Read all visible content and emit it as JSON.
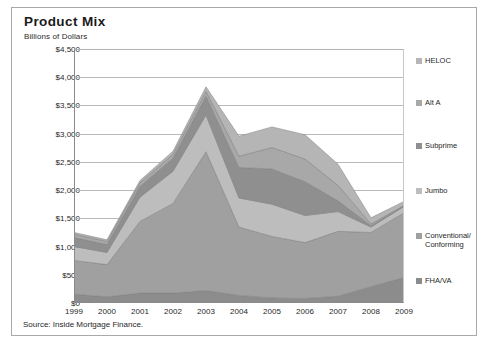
{
  "figure": {
    "title": "Product Mix",
    "subtitle": "Billions of Dollars",
    "source": "Source: Inside Mortgage Finance."
  },
  "chart_data": {
    "type": "area",
    "stacked": true,
    "title": "Product Mix",
    "subtitle": "Billions of Dollars",
    "xlabel": "",
    "ylabel": "Billions of Dollars",
    "ylim": [
      0,
      4500
    ],
    "ytick_step": 500,
    "yticks": [
      0,
      500,
      1000,
      1500,
      2000,
      2500,
      3000,
      3500,
      4000,
      4500
    ],
    "ytick_labels": [
      "$0",
      "$500",
      "$1,000",
      "$1,500",
      "$2,000",
      "$2,500",
      "$3,000",
      "$3,500",
      "$4,000",
      "$4,500"
    ],
    "categories": [
      1999,
      2000,
      2001,
      2002,
      2003,
      2004,
      2005,
      2006,
      2007,
      2008,
      2009
    ],
    "x": [
      "1999",
      "2000",
      "2001",
      "2002",
      "2003",
      "2004",
      "2005",
      "2006",
      "2007",
      "2008",
      "2009"
    ],
    "grid": true,
    "legend_position": "right",
    "series": [
      {
        "name": "FHA/VA",
        "color": "#8c8c8c",
        "values": [
          155,
          110,
          175,
          175,
          220,
          135,
          90,
          80,
          120,
          290,
          450
        ]
      },
      {
        "name": "Conventional/Conforming",
        "color": "#a0a0a0",
        "values": [
          600,
          570,
          1270,
          1590,
          2460,
          1210,
          1090,
          990,
          1150,
          960,
          1150
        ]
      },
      {
        "name": "Jumbo",
        "color": "#bdbdbd",
        "values": [
          245,
          215,
          430,
          570,
          650,
          515,
          570,
          480,
          350,
          95,
          110
        ]
      },
      {
        "name": "Subprime",
        "color": "#8f8f8f",
        "values": [
          160,
          140,
          190,
          230,
          335,
          540,
          625,
          600,
          190,
          25,
          10
        ]
      },
      {
        "name": "Alt A",
        "color": "#a8a8a8",
        "values": [
          60,
          55,
          65,
          70,
          85,
          200,
          380,
          400,
          275,
          30,
          10
        ]
      },
      {
        "name": "HELOC",
        "color": "#b5b5b5",
        "values": [
          30,
          30,
          40,
          55,
          80,
          355,
          365,
          430,
          375,
          110,
          70
        ]
      }
    ],
    "totals": [
      1250,
      1120,
      2170,
      2690,
      3830,
      2955,
      3120,
      2980,
      2460,
      1510,
      1800
    ]
  },
  "legend": {
    "items": [
      {
        "label": "HELOC",
        "color": "#b5b5b5"
      },
      {
        "label": "Alt A",
        "color": "#a8a8a8"
      },
      {
        "label": "Subprime",
        "color": "#8f8f8f"
      },
      {
        "label": "Jumbo",
        "color": "#bdbdbd"
      },
      {
        "label": "Conventional/Conforming",
        "color": "#a0a0a0"
      },
      {
        "label": "FHA/VA",
        "color": "#8c8c8c"
      }
    ]
  },
  "colors": {
    "grid": "#b9b9b9",
    "axis": "#8a8a8a",
    "border": "#a9a9a9",
    "text": "#1f1f1f"
  }
}
